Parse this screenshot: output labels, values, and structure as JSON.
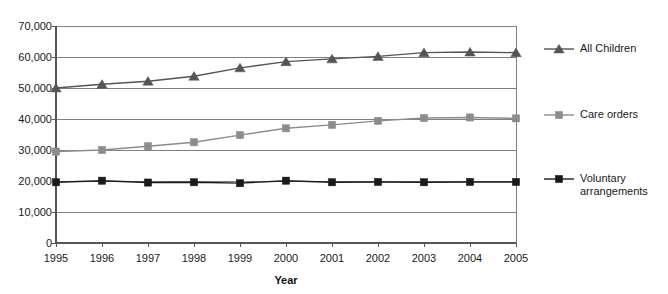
{
  "chart_data": {
    "type": "line",
    "title": "",
    "xlabel": "Year",
    "ylabel": "",
    "categories": [
      "1995",
      "1996",
      "1997",
      "1998",
      "1999",
      "2000",
      "2001",
      "2002",
      "2003",
      "2004",
      "2005"
    ],
    "x_tick_labels": [
      "1995",
      "1996",
      "1997",
      "1998",
      "1999",
      "2000",
      "2001",
      "2002",
      "2003",
      "2004",
      "2005"
    ],
    "y_tick_labels": [
      "0",
      "10,000",
      "20,000",
      "30,000",
      "40,000",
      "50,000",
      "60,000",
      "70,000"
    ],
    "y_ticks": [
      0,
      10000,
      20000,
      30000,
      40000,
      50000,
      60000,
      70000
    ],
    "ylim": [
      0,
      70000
    ],
    "grid": "horizontal",
    "legend_position": "right",
    "series": [
      {
        "name": "All Children",
        "marker": "triangle",
        "color": "#555555",
        "values": [
          50000,
          51200,
          52200,
          53800,
          56500,
          58500,
          59400,
          60200,
          61400,
          61600,
          61400
        ]
      },
      {
        "name": "Care orders",
        "marker": "square",
        "color": "#8c8c8c",
        "values": [
          29500,
          30000,
          31200,
          32500,
          34800,
          37000,
          38100,
          39400,
          40300,
          40500,
          40200
        ]
      },
      {
        "name": "Voluntary arrangements",
        "marker": "square",
        "color": "#1a1a1a",
        "values": [
          19600,
          20100,
          19500,
          19600,
          19300,
          20100,
          19600,
          19700,
          19600,
          19700,
          19700
        ]
      }
    ]
  },
  "legend": {
    "items": [
      {
        "label": "All Children"
      },
      {
        "label": "Care orders"
      },
      {
        "label": "Voluntary\narrangements"
      }
    ]
  },
  "axes": {
    "x_title": "Year"
  }
}
